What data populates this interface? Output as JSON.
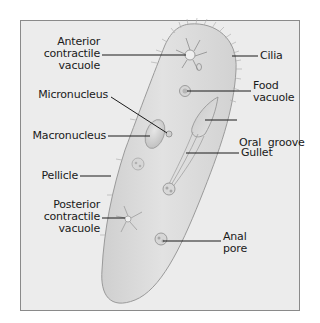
{
  "diagram": {
    "colors": {
      "background": "#ffffff",
      "frame_fill": "#ececec",
      "frame_border": "#8a8a8a",
      "body_fill": "#dcdcdc",
      "body_outline": "#9a9a9a",
      "leader_line": "#1a1a1a",
      "text": "#1a1a1a"
    },
    "labels": {
      "anterior_contractile_vacuole": [
        "Anterior",
        "contractile",
        "vacuole"
      ],
      "cilia": [
        "Cilia"
      ],
      "micronucleus": [
        "Micronucleus"
      ],
      "food_vacuole": [
        "Food",
        "vacuole"
      ],
      "macronucleus": [
        "Macronucleus"
      ],
      "oral_groove": [
        "Oral  groove"
      ],
      "gullet": [
        "Gullet"
      ],
      "pellicle": [
        "Pellicle"
      ],
      "posterior_contractile_vacuole": [
        "Posterior",
        "contractile",
        "vacuole"
      ],
      "anal_pore": [
        "Anal",
        "pore"
      ]
    }
  }
}
